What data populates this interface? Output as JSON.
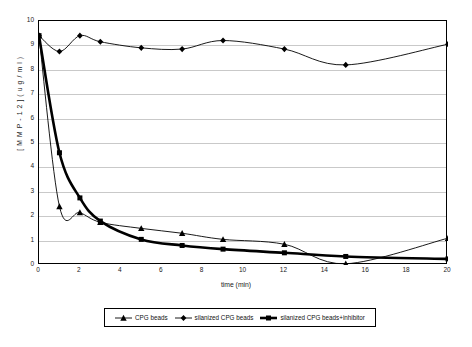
{
  "chart_data": {
    "type": "line",
    "title": "",
    "xlabel": "time (min)",
    "ylabel": "[MMP-12] (ug/ml)",
    "xlim": [
      0,
      20
    ],
    "ylim": [
      0,
      10
    ],
    "xticks": [
      "0",
      "2",
      "4",
      "6",
      "8",
      "10",
      "12",
      "14",
      "16",
      "18",
      "20"
    ],
    "yticks": [
      "0",
      "1",
      "2",
      "3",
      "4",
      "5",
      "6",
      "7",
      "8",
      "9",
      "10"
    ],
    "grid": "horizontal",
    "legend_position": "bottom-center",
    "series": [
      {
        "name": "CPG beads",
        "marker": "triangle",
        "line_weight": "thin",
        "color": "#000000",
        "x": [
          0,
          1,
          2,
          3,
          5,
          7,
          9,
          12,
          15,
          20
        ],
        "y": [
          9.4,
          2.4,
          2.15,
          1.75,
          1.5,
          1.3,
          1.05,
          0.85,
          0.05,
          1.1
        ]
      },
      {
        "name": "silanized CPG beads",
        "marker": "diamond",
        "line_weight": "thin",
        "color": "#000000",
        "x": [
          0,
          1,
          2,
          3,
          5,
          7,
          9,
          12,
          15,
          20
        ],
        "y": [
          9.4,
          8.75,
          9.4,
          9.15,
          8.9,
          8.85,
          9.2,
          8.85,
          8.2,
          9.05
        ]
      },
      {
        "name": "silanized CPG beads+inhibitor",
        "marker": "square",
        "line_weight": "thick",
        "color": "#000000",
        "x": [
          0,
          1,
          2,
          3,
          5,
          7,
          9,
          12,
          15,
          20
        ],
        "y": [
          9.4,
          4.6,
          2.75,
          1.8,
          1.05,
          0.8,
          0.65,
          0.5,
          0.35,
          0.25
        ]
      }
    ]
  },
  "axis": {
    "xlabel": "time (min)",
    "ylabel": "[ M M P - 1 2 ]  ( u g / m l )"
  },
  "legend": {
    "entries": [
      {
        "label": "CPG beads",
        "marker": "triangle-marker-icon"
      },
      {
        "label": "silanized CPG beads",
        "marker": "diamond-marker-icon"
      },
      {
        "label": "silanized CPG beads+inhibitor",
        "marker": "square-marker-icon"
      }
    ]
  }
}
